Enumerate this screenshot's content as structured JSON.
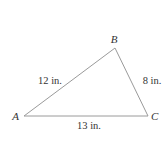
{
  "diagram": {
    "type": "triangle",
    "stroke_color": "#9a9a9a",
    "text_color": "#333333",
    "vertices": [
      {
        "name": "A",
        "x": 24,
        "y": 116,
        "label_x": 19,
        "label_y": 120,
        "anchor": "end"
      },
      {
        "name": "B",
        "x": 115,
        "y": 48,
        "label_x": 114,
        "label_y": 43,
        "anchor": "middle"
      },
      {
        "name": "C",
        "x": 148,
        "y": 116,
        "label_x": 151,
        "label_y": 120,
        "anchor": "start"
      }
    ],
    "sides": [
      {
        "from": "A",
        "to": "B",
        "label": "12 in.",
        "label_x": 50,
        "label_y": 84,
        "anchor": "middle"
      },
      {
        "from": "B",
        "to": "C",
        "label": "8 in.",
        "label_x": 152,
        "label_y": 84,
        "anchor": "middle"
      },
      {
        "from": "A",
        "to": "C",
        "label": "13 in.",
        "label_x": 89,
        "label_y": 129,
        "anchor": "middle"
      }
    ]
  }
}
